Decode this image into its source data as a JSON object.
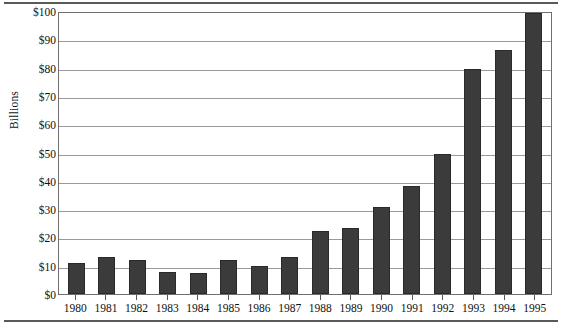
{
  "chart_data": {
    "type": "bar",
    "title": "",
    "subtitle": "",
    "xlabel": "",
    "ylabel": "Billions",
    "categories": [
      "1980",
      "1981",
      "1982",
      "1983",
      "1984",
      "1985",
      "1986",
      "1987",
      "1988",
      "1989",
      "1990",
      "1991",
      "1992",
      "1993",
      "1994",
      "1995"
    ],
    "values": [
      11,
      13,
      12,
      8,
      7.5,
      12,
      10,
      13,
      22.5,
      23.5,
      31,
      38.5,
      50,
      80,
      87,
      100
    ],
    "ylim": [
      0,
      100
    ],
    "ytick_values": [
      0,
      10,
      20,
      30,
      40,
      50,
      60,
      70,
      80,
      90,
      100
    ],
    "ytick_labels": [
      "$0",
      "$10",
      "$20",
      "$30",
      "$40",
      "$50",
      "$60",
      "$70",
      "$80",
      "$90",
      "$100"
    ],
    "grid": true,
    "legend": false,
    "legend_position": "none",
    "series": [
      {
        "name": "Billions",
        "values": [
          11,
          13,
          12,
          8,
          7.5,
          12,
          10,
          13,
          22.5,
          23.5,
          31,
          38.5,
          50,
          80,
          87,
          100
        ]
      }
    ],
    "colors": {
      "bar_fill": "#3b3b3b",
      "bar_stroke": "#2a2a2a",
      "gridline": "#9a9a9a",
      "plot_border": "#6f6f6f",
      "rule": "#5a5a5a",
      "text": "#111111",
      "background": "#ffffff"
    }
  }
}
